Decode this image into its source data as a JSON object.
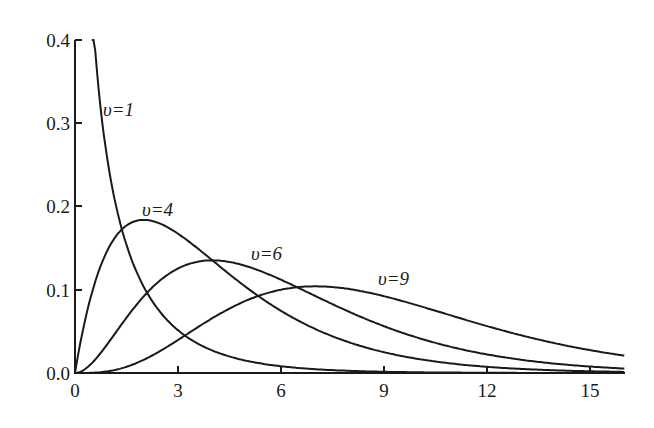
{
  "chart_data": {
    "type": "line",
    "title": "",
    "xlabel": "",
    "ylabel": "",
    "xlim": [
      0,
      16
    ],
    "ylim": [
      0,
      0.4
    ],
    "grid": false,
    "legend": "inline curve labels",
    "x_ticks": [
      "0",
      "3",
      "6",
      "9",
      "12",
      "15"
    ],
    "y_ticks": [
      "0.0",
      "0.1",
      "0.2",
      "0.3",
      "0.4"
    ],
    "x": [
      0,
      0.5,
      1,
      1.5,
      2,
      3,
      4,
      5,
      6,
      7,
      8,
      9,
      10,
      11,
      12,
      13,
      14,
      15,
      16
    ],
    "series": [
      {
        "name": "υ=1",
        "df": 1,
        "values": [
          null,
          0.439,
          0.242,
          0.154,
          0.104,
          0.051,
          0.027,
          0.015,
          0.008,
          0.005,
          0.003,
          0.002,
          0.001,
          0.001,
          0.0,
          0.0,
          0.0,
          0.0,
          0.0
        ]
      },
      {
        "name": "υ=4",
        "df": 4,
        "values": [
          0.0,
          0.097,
          0.152,
          0.177,
          0.184,
          0.167,
          0.135,
          0.103,
          0.075,
          0.053,
          0.037,
          0.025,
          0.017,
          0.011,
          0.007,
          0.005,
          0.003,
          0.002,
          0.001
        ]
      },
      {
        "name": "υ=6",
        "df": 6,
        "values": [
          0.0,
          0.005,
          0.038,
          0.063,
          0.09,
          0.126,
          0.135,
          0.128,
          0.112,
          0.092,
          0.073,
          0.056,
          0.042,
          0.031,
          0.022,
          0.016,
          0.011,
          0.008,
          0.005
        ]
      },
      {
        "name": "υ=9",
        "df": 9,
        "values": [
          0.0,
          0.0,
          0.002,
          0.008,
          0.016,
          0.046,
          0.072,
          0.092,
          0.102,
          0.103,
          0.098,
          0.088,
          0.077,
          0.064,
          0.053,
          0.042,
          0.033,
          0.025,
          0.019
        ]
      }
    ],
    "annotations": [
      {
        "text": "υ=1",
        "x": 0.75,
        "y": 0.33
      },
      {
        "text": "υ=4",
        "x": 1.9,
        "y": 0.195
      },
      {
        "text": "υ=6",
        "x": 4.8,
        "y": 0.145
      },
      {
        "text": "υ=9",
        "x": 8.8,
        "y": 0.11
      }
    ]
  },
  "axes": {
    "x_ticks": [
      {
        "value": 0,
        "label": "0"
      },
      {
        "value": 3,
        "label": "3"
      },
      {
        "value": 6,
        "label": "6"
      },
      {
        "value": 9,
        "label": "9"
      },
      {
        "value": 12,
        "label": "12"
      },
      {
        "value": 15,
        "label": "15"
      }
    ],
    "y_ticks": [
      {
        "value": 0.0,
        "label": "0.0"
      },
      {
        "value": 0.1,
        "label": "0.1"
      },
      {
        "value": 0.2,
        "label": "0.2"
      },
      {
        "value": 0.3,
        "label": "0.3"
      },
      {
        "value": 0.4,
        "label": "0.4"
      }
    ]
  },
  "labels": {
    "df1": "υ=1",
    "df4": "υ=4",
    "df6": "υ=6",
    "df9": "υ=9"
  }
}
